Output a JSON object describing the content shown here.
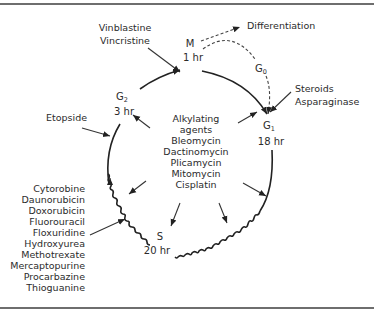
{
  "phases": {
    "M": {
      "label": "M",
      "duration": "1 hr"
    },
    "G0": {
      "label": "G",
      "sub": "0"
    },
    "G1": {
      "label": "G",
      "sub": "1",
      "duration": "18 hr"
    },
    "S": {
      "label": "S",
      "duration": "20 hr"
    },
    "G2": {
      "label": "G",
      "sub": "2",
      "duration": "3 hr"
    }
  },
  "outcomes": {
    "differentiation": "Differentiation"
  },
  "drug_groups": {
    "m_phase": [
      "Vinblastine",
      "Vincristine"
    ],
    "g1_phase": [
      "Steroids",
      "Asparaginase"
    ],
    "g2_phase": [
      "Etopside"
    ],
    "nonspecific": [
      "Alkylating",
      "agents",
      "Bleomycin",
      "Dactinomycin",
      "Plicamycin",
      "Mitomycin",
      "Cisplatin"
    ],
    "s_phase": [
      "Cytorobine",
      "Daunorubicin",
      "Doxorubicin",
      "Fluorouracil",
      "Floxuridine",
      "Hydroxyurea",
      "Methotrexate",
      "Mercaptopurine",
      "Procarbazine",
      "Thioguanine"
    ]
  }
}
